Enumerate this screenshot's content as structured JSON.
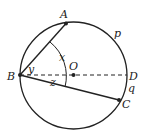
{
  "diagram": {
    "type": "circle-geometry",
    "circle": {
      "center_label": "O"
    },
    "points": {
      "A": {
        "label": "A"
      },
      "B": {
        "label": "B"
      },
      "C": {
        "label": "C"
      },
      "D": {
        "label": "D"
      },
      "O": {
        "label": "O"
      }
    },
    "angles": {
      "x": "x",
      "y": "y",
      "z": "z"
    },
    "arcs": {
      "p": "p",
      "q": "q"
    },
    "segments": [
      "BA",
      "BC",
      "BD (dashed, diameter)"
    ],
    "colors": {
      "stroke": "#222222",
      "background": "#ffffff"
    }
  }
}
